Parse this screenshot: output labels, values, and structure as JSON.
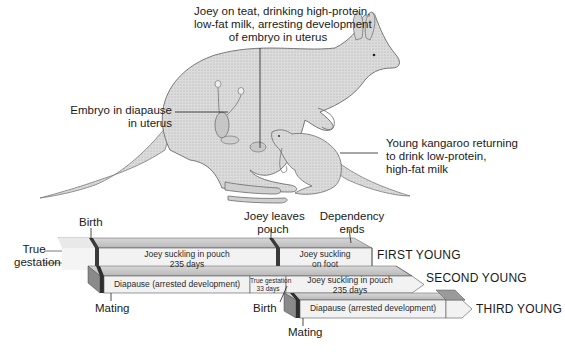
{
  "illustration": {
    "callouts": {
      "joey_on_teat": [
        "Joey on teat, drinking high-protein,",
        "low-fat milk, arresting development",
        "of embryo in uterus"
      ],
      "embryo": [
        "Embryo in diapause",
        "in uterus"
      ],
      "young_kangaroo": [
        "Young kangaroo returning",
        "to drink low-protein,",
        "high-fat milk"
      ]
    }
  },
  "timeline": {
    "milestones": {
      "birth_top": "Birth",
      "joey_leaves_pouch": [
        "Joey leaves",
        "pouch"
      ],
      "dependency_ends": [
        "Dependency",
        "ends"
      ],
      "true_gestation_left": [
        "True",
        "gestation"
      ],
      "mating_1": "Mating",
      "birth_2": "Birth",
      "mating_2": "Mating"
    },
    "rows": [
      {
        "label": "FIRST YOUNG",
        "segments": [
          {
            "text": [
              "Joey suckling in pouch",
              "235 days"
            ]
          },
          {
            "text": [
              "Joey suckling",
              "on foot"
            ]
          }
        ]
      },
      {
        "label": "SECOND YOUNG",
        "segments": [
          {
            "text": [
              "Diapause (arrested development)"
            ]
          },
          {
            "text": [
              "True gestation",
              "33 days"
            ]
          },
          {
            "text": [
              "Joey suckling in pouch",
              "235 days"
            ]
          }
        ]
      },
      {
        "label": "THIRD YOUNG",
        "segments": [
          {
            "text": [
              "Diapause (arrested development)"
            ]
          }
        ]
      }
    ]
  },
  "colors": {
    "bar_face": "#efefef",
    "bar_top": "#c4c4c4",
    "bar_side": "#8a8a8a",
    "bar_edge": "#3a3a3a",
    "kangaroo_fill": "#d9d9d9",
    "kangaroo_stroke": "#6a6a6a"
  }
}
